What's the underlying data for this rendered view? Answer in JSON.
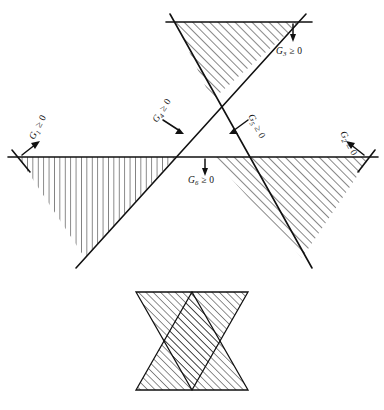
{
  "figure": {
    "title": "",
    "background_color": "#ffffff",
    "line_color": "#111111",
    "constraint_labels": [
      {
        "id": "G1",
        "name": "G1",
        "subscript": "1",
        "relation": "≥",
        "value": "0",
        "text": "G₁ ≥ 0",
        "position": "upper-left",
        "rotation": -62,
        "arrow_direction": "up-left"
      },
      {
        "id": "G2",
        "name": "G2",
        "subscript": "2",
        "relation": "≥",
        "value": "0",
        "text": "G₂ ≥ 0",
        "position": "upper-right",
        "rotation": 62,
        "arrow_direction": "up-right"
      },
      {
        "id": "G3",
        "name": "G3",
        "subscript": "3",
        "relation": "≥",
        "value": "0",
        "text": "G₃ ≥ 0",
        "position": "top-right",
        "rotation": 0,
        "arrow_direction": "down"
      },
      {
        "id": "G4",
        "name": "G4",
        "subscript": "4",
        "relation": "≥",
        "value": "0",
        "text": "G₄ ≥ 0",
        "position": "center-left",
        "rotation": -57,
        "arrow_direction": "down-right"
      },
      {
        "id": "G5",
        "name": "G5",
        "subscript": "5",
        "relation": "≥",
        "value": "0",
        "text": "G₅ ≥ 0",
        "position": "center-right",
        "rotation": 62,
        "arrow_direction": "down-left"
      },
      {
        "id": "G6",
        "name": "G6",
        "subscript": "6",
        "relation": "≥",
        "value": "0",
        "text": "G₆ ≥ 0",
        "position": "center-bottom",
        "rotation": 0,
        "arrow_direction": "down"
      }
    ],
    "shapes": {
      "top_triangle": {
        "name": "top-triangle",
        "hatch": "diagonal",
        "points": "175,22 300,22 212,100"
      },
      "left_triangle": {
        "name": "left-triangle",
        "hatch": "vertical",
        "points": "18,157 175,157 85,258"
      },
      "right_triangle": {
        "name": "right-triangle",
        "hatch": "diagonal",
        "points": "212,157 370,157 302,258"
      },
      "star": {
        "name": "hexagram-star",
        "hatch": "diagonal",
        "up_triangle": "192,292 248,390 136,390",
        "down_triangle": "192,390 136,292 248,292"
      }
    }
  }
}
